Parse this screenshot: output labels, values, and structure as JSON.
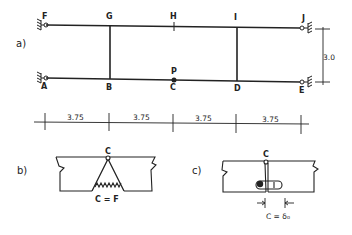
{
  "figure": {
    "part_a": {
      "label": "a)",
      "nodes": {
        "top": [
          "F",
          "G",
          "H",
          "I",
          "J"
        ],
        "bottom": [
          "A",
          "B",
          "C",
          "D",
          "E"
        ],
        "load_point": "P"
      },
      "span_dimensions": [
        "3.75",
        "3.75",
        "3.75",
        "3.75"
      ],
      "height_dimension": "3.0"
    },
    "part_b": {
      "label": "b)",
      "hinge_label": "C",
      "spring_label": "C = F"
    },
    "part_c": {
      "label": "c)",
      "hinge_label": "C",
      "gap_label": "C = δ₀"
    }
  },
  "colors": {
    "ink": "#222222",
    "background": "#ffffff"
  }
}
